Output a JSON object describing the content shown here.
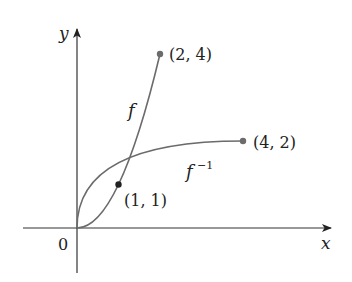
{
  "diagram": {
    "type": "function-and-inverse-graph",
    "origin_label": "0",
    "axes": {
      "x_label": "x",
      "y_label": "y"
    },
    "curves": [
      {
        "name": "f",
        "label": "f",
        "expression": "y = x^2",
        "domain": [
          0,
          2
        ],
        "color": "#6b6b6b"
      },
      {
        "name": "f_inverse",
        "label": "f",
        "label_sup": "−1",
        "expression": "y = sqrt(x)",
        "domain": [
          0,
          4
        ],
        "color": "#6b6b6b"
      }
    ],
    "points": [
      {
        "label": "(2, 4)",
        "x": 2,
        "y": 4
      },
      {
        "label": "(4, 2)",
        "x": 4,
        "y": 2
      },
      {
        "label": "(1, 1)",
        "x": 1,
        "y": 1
      }
    ],
    "colors": {
      "axis": "#222222",
      "curve": "#6b6b6b",
      "point": "#6b6b6b",
      "intersection": "#222222",
      "text": "#222222"
    }
  }
}
